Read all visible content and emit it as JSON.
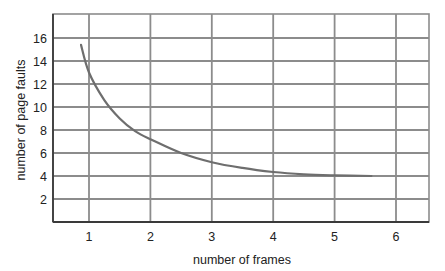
{
  "chart_data": {
    "type": "line",
    "title": "",
    "xlabel": "number of frames",
    "ylabel": "number of page faults",
    "xlim": [
      0.4,
      6.55
    ],
    "ylim": [
      0,
      18
    ],
    "x_ticks": [
      1,
      2,
      3,
      4,
      5,
      6
    ],
    "y_ticks": [
      2,
      4,
      6,
      8,
      10,
      12,
      14,
      16
    ],
    "grid": true,
    "legend": null,
    "series": [
      {
        "name": "page faults vs frames",
        "x": [
          0.87,
          1.0,
          1.25,
          1.5,
          1.75,
          2.0,
          2.5,
          3.0,
          3.5,
          4.0,
          4.5,
          5.0,
          5.6
        ],
        "y": [
          15.4,
          13.0,
          10.6,
          9.0,
          7.9,
          7.2,
          6.0,
          5.2,
          4.7,
          4.35,
          4.15,
          4.05,
          4.0
        ]
      }
    ]
  },
  "colors": {
    "grid": "#8c8c8c",
    "axis": "#3a3a3a",
    "curve": "#6e6e6e",
    "text": "#222222"
  }
}
